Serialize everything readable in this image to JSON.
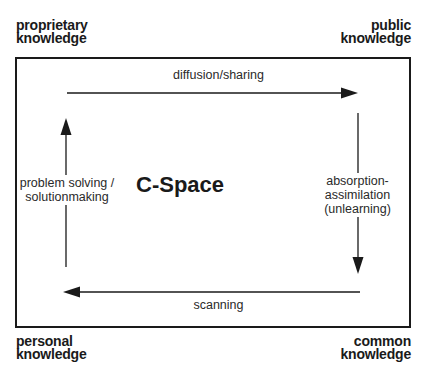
{
  "diagram": {
    "title": "C-Space",
    "corners": {
      "top_left": [
        "proprietary",
        "knowledge"
      ],
      "top_right": [
        "public",
        "knowledge"
      ],
      "bottom_left": [
        "personal",
        "knowledge"
      ],
      "bottom_right": [
        "common",
        "knowledge"
      ]
    },
    "flows": {
      "top": {
        "label": "diffusion/sharing",
        "direction": "right",
        "from": "proprietary knowledge",
        "to": "public knowledge"
      },
      "right": {
        "label_lines": [
          "absorption-",
          "assimilation",
          "(unlearning)"
        ],
        "direction": "down",
        "from": "public knowledge",
        "to": "common knowledge"
      },
      "bottom": {
        "label": "scanning",
        "direction": "left",
        "from": "common knowledge",
        "to": "personal knowledge"
      },
      "left": {
        "label_lines": [
          "problem solving /",
          "solutionmaking"
        ],
        "direction": "up",
        "from": "personal knowledge",
        "to": "proprietary knowledge"
      }
    },
    "colors": {
      "ink": "#1a1a1a",
      "background": "#ffffff",
      "label_text": "#2a2a2a"
    }
  }
}
